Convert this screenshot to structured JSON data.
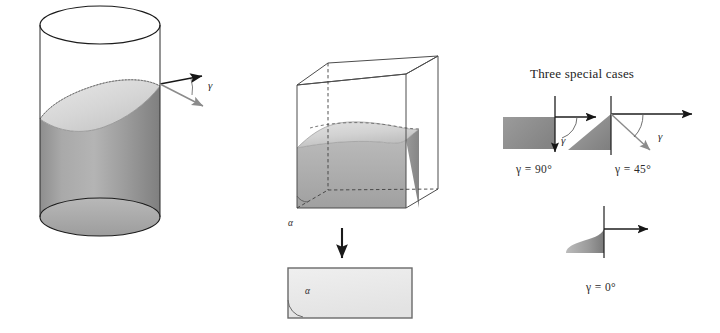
{
  "figure": {
    "panels": [
      {
        "name": "cylinder-panel",
        "shape": "cylinder",
        "description": "Vertical cylinder partly filled with liquid whose surface is a curved (saddle) meniscus",
        "angle_symbol": "γ"
      },
      {
        "name": "cube-panel",
        "shape": "cube",
        "description": "Cube partly filled with liquid with concave meniscus; projection arrow to plan rectangle",
        "angle_symbol": "α"
      },
      {
        "name": "special-cases-panel",
        "description": "Three special cases of the contact angle gamma"
      }
    ]
  },
  "cylinder": {
    "gamma_label": "γ"
  },
  "cube": {
    "alpha_label": "α",
    "projection_alpha_label": "α"
  },
  "special_cases": {
    "title": "Three special cases",
    "cases": [
      {
        "id": "case-90",
        "caption": "γ  =  90°",
        "gamma_symbol": "γ",
        "angle_deg": 90,
        "liquid_shape": "rectangle"
      },
      {
        "id": "case-45",
        "caption": "γ  =  45°",
        "gamma_symbol": "γ",
        "angle_deg": 45,
        "liquid_shape": "triangle-wedge"
      },
      {
        "id": "case-0",
        "caption": "γ  =  0°",
        "gamma_symbol": "",
        "angle_deg": 0,
        "liquid_shape": "concave-fillet"
      }
    ]
  },
  "colors": {
    "outline": "#1a1a1a",
    "liquid_dark": "#8d8d8d",
    "liquid_mid": "#a5a5a5",
    "liquid_light": "#cfcfcf",
    "surface_light": "#dcdcdc",
    "wire": "#555555",
    "dashed": "#444444",
    "gray_arrow": "#8a8a8a",
    "background": "#ffffff"
  }
}
